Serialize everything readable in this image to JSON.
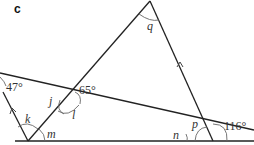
{
  "figure": {
    "part_label": "c",
    "angles": {
      "given_top_left": "47°",
      "given_intersection": "65°",
      "given_bottom_right": "116°",
      "q": "q",
      "j": "j",
      "l": "l",
      "k": "k",
      "m": "m",
      "n": "n",
      "p": "p"
    },
    "colors": {
      "line": "#222222",
      "arc": "#555555",
      "text": "#333333"
    }
  }
}
